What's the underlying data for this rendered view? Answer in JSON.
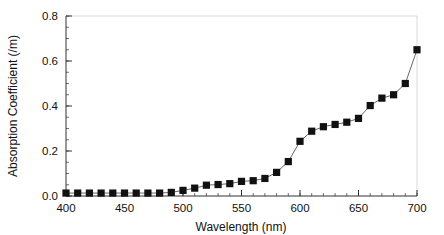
{
  "chart_data": {
    "type": "scatter",
    "title": "",
    "xlabel": "Wavelength (nm)",
    "ylabel": "Absorption Coefficient (/m)",
    "xlim": [
      400,
      700
    ],
    "ylim": [
      0.0,
      0.8
    ],
    "xticks": [
      400,
      450,
      500,
      550,
      600,
      650,
      700
    ],
    "xtick_labels": [
      "400",
      "450",
      "500",
      "550",
      "600",
      "650",
      "700"
    ],
    "yticks": [
      0.0,
      0.2,
      0.4,
      0.6,
      0.8
    ],
    "ytick_labels": [
      "0.0",
      "0.2",
      "0.4",
      "0.6",
      "0.8"
    ],
    "x_minor_tick_step": 10,
    "y_minor_tick_step": 0.05,
    "grid": false,
    "legend": null,
    "marker": "square",
    "marker_color": "#111111",
    "line_color": "#555555",
    "x": [
      400,
      410,
      420,
      430,
      440,
      450,
      460,
      470,
      480,
      490,
      500,
      510,
      520,
      530,
      540,
      550,
      560,
      570,
      580,
      590,
      600,
      610,
      620,
      630,
      640,
      650,
      660,
      670,
      680,
      690,
      700
    ],
    "values": [
      0.013,
      0.013,
      0.013,
      0.013,
      0.013,
      0.013,
      0.013,
      0.013,
      0.013,
      0.016,
      0.025,
      0.035,
      0.048,
      0.051,
      0.055,
      0.065,
      0.068,
      0.078,
      0.105,
      0.153,
      0.243,
      0.288,
      0.308,
      0.318,
      0.328,
      0.345,
      0.402,
      0.435,
      0.45,
      0.5,
      0.65
    ],
    "series": [
      {
        "name": "Absorption Coefficient",
        "values": [
          0.013,
          0.013,
          0.013,
          0.013,
          0.013,
          0.013,
          0.013,
          0.013,
          0.013,
          0.016,
          0.025,
          0.035,
          0.048,
          0.051,
          0.055,
          0.065,
          0.068,
          0.078,
          0.105,
          0.153,
          0.243,
          0.288,
          0.308,
          0.318,
          0.328,
          0.345,
          0.402,
          0.435,
          0.45,
          0.5,
          0.65
        ]
      }
    ]
  }
}
